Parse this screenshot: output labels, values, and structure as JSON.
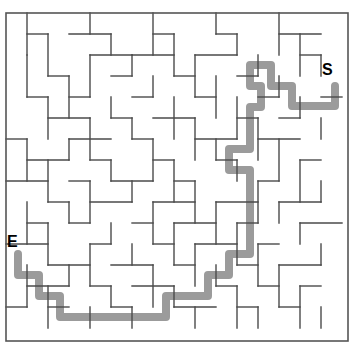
{
  "figure": {
    "kind": "maze-puzzle",
    "width": 353,
    "height": 345,
    "background_color": "#ffffff"
  },
  "labels": {
    "start": "S",
    "end": "E"
  },
  "maze": {
    "origin_x": 6,
    "origin_y": 13,
    "cell": 21,
    "cols": 16,
    "rows": 15,
    "wall_color": "#4a4a4a",
    "wall_width": 1.4,
    "border_color": "#555555",
    "border_width": 1.6,
    "border": [
      6,
      13,
      342,
      328
    ],
    "h_walls": [
      [
        1,
        1,
        2
      ],
      [
        3,
        1,
        5
      ],
      [
        7,
        1,
        8
      ],
      [
        10,
        1,
        11
      ],
      [
        13,
        1,
        15
      ],
      [
        4,
        2,
        6
      ],
      [
        6,
        2,
        8
      ],
      [
        9,
        2,
        11
      ],
      [
        14,
        2,
        15
      ],
      [
        2,
        3,
        3
      ],
      [
        5,
        3,
        6
      ],
      [
        8,
        3,
        9
      ],
      [
        11,
        3,
        12
      ],
      [
        1,
        4,
        2
      ],
      [
        3,
        4,
        4
      ],
      [
        6,
        4,
        7
      ],
      [
        9,
        4,
        10
      ],
      [
        12,
        4,
        13
      ],
      [
        15,
        4,
        16
      ],
      [
        2,
        5,
        4
      ],
      [
        5,
        5,
        6
      ],
      [
        7,
        5,
        9
      ],
      [
        11,
        5,
        12
      ],
      [
        13,
        5,
        14
      ],
      [
        0,
        6,
        1
      ],
      [
        3,
        6,
        5
      ],
      [
        6,
        6,
        7
      ],
      [
        9,
        6,
        11
      ],
      [
        12,
        6,
        14
      ],
      [
        1,
        7,
        3
      ],
      [
        4,
        7,
        5
      ],
      [
        7,
        7,
        8
      ],
      [
        10,
        7,
        11
      ],
      [
        14,
        7,
        15
      ],
      [
        0,
        8,
        2
      ],
      [
        3,
        8,
        4
      ],
      [
        5,
        8,
        7
      ],
      [
        8,
        8,
        9
      ],
      [
        12,
        8,
        13
      ],
      [
        2,
        9,
        3
      ],
      [
        4,
        9,
        6
      ],
      [
        7,
        9,
        9
      ],
      [
        10,
        9,
        12
      ],
      [
        13,
        9,
        15
      ],
      [
        1,
        10,
        2
      ],
      [
        3,
        10,
        4
      ],
      [
        6,
        10,
        7
      ],
      [
        8,
        10,
        10
      ],
      [
        11,
        10,
        12
      ],
      [
        14,
        10,
        16
      ],
      [
        0,
        11,
        2
      ],
      [
        4,
        11,
        5
      ],
      [
        7,
        11,
        8
      ],
      [
        9,
        11,
        11
      ],
      [
        12,
        11,
        13
      ],
      [
        2,
        12,
        4
      ],
      [
        5,
        12,
        7
      ],
      [
        8,
        12,
        9
      ],
      [
        11,
        12,
        12
      ],
      [
        13,
        12,
        15
      ],
      [
        1,
        13,
        3
      ],
      [
        4,
        13,
        5
      ],
      [
        6,
        13,
        8
      ],
      [
        10,
        13,
        11
      ],
      [
        12,
        13,
        13
      ],
      [
        14,
        13,
        15
      ],
      [
        0,
        14,
        1
      ],
      [
        2,
        14,
        3
      ],
      [
        5,
        14,
        6
      ],
      [
        8,
        14,
        10
      ],
      [
        11,
        14,
        12
      ],
      [
        13,
        14,
        14
      ]
    ],
    "v_walls": [
      [
        1,
        0,
        2
      ],
      [
        4,
        0,
        1
      ],
      [
        7,
        0,
        2
      ],
      [
        10,
        0,
        1
      ],
      [
        13,
        0,
        2
      ],
      [
        2,
        1,
        3
      ],
      [
        5,
        1,
        2
      ],
      [
        8,
        1,
        3
      ],
      [
        11,
        1,
        2
      ],
      [
        14,
        1,
        3
      ],
      [
        1,
        2,
        4
      ],
      [
        4,
        2,
        4
      ],
      [
        6,
        2,
        3
      ],
      [
        9,
        2,
        4
      ],
      [
        12,
        2,
        3
      ],
      [
        15,
        2,
        3
      ],
      [
        3,
        3,
        5
      ],
      [
        7,
        3,
        4
      ],
      [
        10,
        3,
        5
      ],
      [
        13,
        3,
        4
      ],
      [
        2,
        4,
        6
      ],
      [
        5,
        4,
        5
      ],
      [
        8,
        4,
        6
      ],
      [
        11,
        4,
        6
      ],
      [
        14,
        4,
        5
      ],
      [
        4,
        5,
        7
      ],
      [
        6,
        5,
        6
      ],
      [
        9,
        5,
        7
      ],
      [
        12,
        5,
        7
      ],
      [
        15,
        5,
        6
      ],
      [
        1,
        6,
        8
      ],
      [
        3,
        6,
        7
      ],
      [
        7,
        6,
        8
      ],
      [
        10,
        6,
        7
      ],
      [
        13,
        6,
        8
      ],
      [
        2,
        7,
        9
      ],
      [
        5,
        7,
        8
      ],
      [
        8,
        7,
        9
      ],
      [
        11,
        7,
        8
      ],
      [
        14,
        7,
        9
      ],
      [
        4,
        8,
        10
      ],
      [
        6,
        8,
        9
      ],
      [
        9,
        8,
        10
      ],
      [
        12,
        8,
        10
      ],
      [
        15,
        8,
        9
      ],
      [
        1,
        9,
        11
      ],
      [
        3,
        9,
        10
      ],
      [
        7,
        9,
        11
      ],
      [
        10,
        9,
        11
      ],
      [
        13,
        9,
        10
      ],
      [
        2,
        10,
        12
      ],
      [
        5,
        10,
        11
      ],
      [
        8,
        10,
        12
      ],
      [
        11,
        10,
        12
      ],
      [
        14,
        10,
        11
      ],
      [
        4,
        11,
        13
      ],
      [
        6,
        11,
        12
      ],
      [
        9,
        11,
        13
      ],
      [
        12,
        11,
        13
      ],
      [
        15,
        11,
        12
      ],
      [
        1,
        12,
        14
      ],
      [
        3,
        12,
        13
      ],
      [
        7,
        12,
        14
      ],
      [
        10,
        12,
        13
      ],
      [
        13,
        12,
        14
      ],
      [
        2,
        13,
        15
      ],
      [
        5,
        13,
        14
      ],
      [
        8,
        13,
        14
      ],
      [
        11,
        13,
        15
      ],
      [
        14,
        13,
        15
      ],
      [
        4,
        14,
        15
      ],
      [
        6,
        14,
        15
      ],
      [
        9,
        14,
        15
      ],
      [
        12,
        14,
        15
      ],
      [
        15,
        14,
        15
      ]
    ]
  },
  "solution_path": {
    "color": "#9b9b9b",
    "stroke_width": 8,
    "start_marker": "S",
    "end_marker": "E",
    "points": [
      [
        335,
        86
      ],
      [
        335,
        106
      ],
      [
        292,
        106
      ],
      [
        292,
        86
      ],
      [
        271,
        86
      ],
      [
        271,
        65
      ],
      [
        250,
        65
      ],
      [
        250,
        86
      ],
      [
        261,
        86
      ],
      [
        261,
        107
      ],
      [
        250,
        107
      ],
      [
        250,
        149
      ],
      [
        229,
        149
      ],
      [
        229,
        170
      ],
      [
        250,
        170
      ],
      [
        250,
        254
      ],
      [
        229,
        254
      ],
      [
        229,
        275
      ],
      [
        208,
        275
      ],
      [
        208,
        296
      ],
      [
        166,
        296
      ],
      [
        166,
        317
      ],
      [
        60,
        317
      ],
      [
        60,
        296
      ],
      [
        39,
        296
      ],
      [
        39,
        275
      ],
      [
        18,
        275
      ],
      [
        18,
        254
      ]
    ]
  }
}
